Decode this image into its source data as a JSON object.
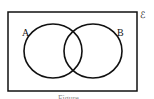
{
  "diagram": {
    "type": "venn",
    "universal_set_label": "ℰ",
    "sets": [
      {
        "label": "A"
      },
      {
        "label": "B"
      }
    ],
    "caption": "Figure"
  }
}
